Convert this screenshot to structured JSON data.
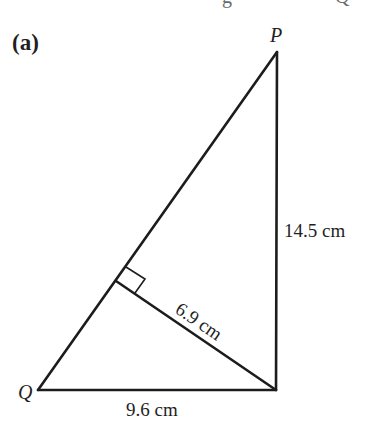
{
  "figure": {
    "part_label": "(a)",
    "clipped_header_text": "g",
    "clipped_header_text_2": "Q",
    "vertices": {
      "P": {
        "label": "P",
        "x": 277,
        "y": 52
      },
      "Q": {
        "label": "Q",
        "x": 38,
        "y": 390
      },
      "R": {
        "label": "",
        "x": 276,
        "y": 390
      },
      "F": {
        "label": "",
        "x": 116,
        "y": 281
      }
    },
    "measurements": {
      "PR": "14.5 cm",
      "FR": "6.9 cm",
      "QR": "9.6 cm"
    },
    "right_angle_marker": {
      "at": "F",
      "size_px": 17
    },
    "colors": {
      "line": "#1c1c1c",
      "text": "#1f1f1f",
      "background": "#ffffff"
    }
  }
}
